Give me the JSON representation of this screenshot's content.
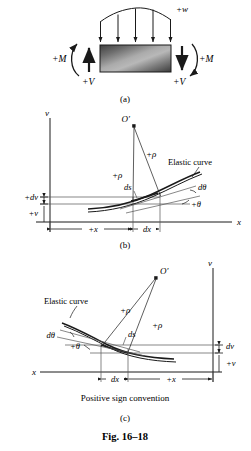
{
  "figure": {
    "number": "Fig. 16–18",
    "panels": [
      {
        "id": "a",
        "caption": "(a)",
        "labels": {
          "distributed_load": "+w",
          "moment_left": "+M",
          "moment_right": "+M",
          "shear_left": "+V",
          "shear_right": "+V"
        },
        "load_arrow_count": 5
      },
      {
        "id": "b",
        "caption": "(b)",
        "labels": {
          "center_point": "O′",
          "radius_left": "+ρ",
          "radius_right": "+ρ",
          "arc_length": "ds",
          "curve_name": "Elastic curve",
          "angle_increment": "dθ",
          "angle": "+θ",
          "axis_vertical": "v",
          "axis_horizontal": "x",
          "deflection_increment": "+dv",
          "deflection": "+v",
          "distance": "+x",
          "distance_increment": "dx"
        }
      },
      {
        "id": "c",
        "caption": "(c)",
        "subcaption": "Positive sign convention",
        "labels": {
          "center_point": "O′",
          "radius_left": "+ρ",
          "radius_right": "+ρ",
          "arc_length": "ds",
          "curve_name": "Elastic curve",
          "angle_increment": "dθ",
          "angle": "+θ",
          "axis_vertical": "v",
          "axis_horizontal": "x",
          "deflection_increment": "dv",
          "deflection": "+v",
          "distance": "+x",
          "distance_increment": "dx"
        }
      }
    ]
  },
  "colors": {
    "ink": "#1a1a1a",
    "line": "#2b2b2b",
    "thin": "#555555",
    "beam_dark": "#3a3a3a",
    "beam_light": "#b5b5b5",
    "background": "#ffffff"
  }
}
